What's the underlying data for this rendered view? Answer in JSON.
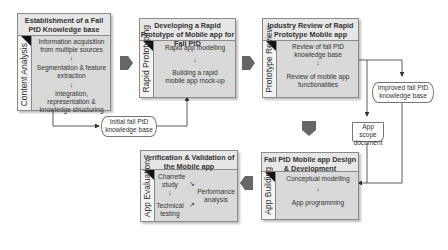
{
  "stages": [
    {
      "id": "content-analysis",
      "title": "Establishment of a Fall PtD Knowledge base",
      "side_label": "Content Analysis",
      "steps": [
        "Information acquisition from multiple sources",
        "Segmentation & feature extraction",
        "Integration, representation & knowledge structuring"
      ]
    },
    {
      "id": "rapid-prototyping",
      "title": "Developing a Rapid Prototype of Mobile app for Fall PtD",
      "side_label": "Rapid Prototyping",
      "steps": [
        "Rapid app modelling",
        "Building a rapid mobile app mock-up"
      ]
    },
    {
      "id": "prototype-review",
      "title": "Industry Review of Rapid Prototype Mobile app",
      "side_label": "Prototype Review",
      "steps": [
        "Review of fall PtD knowledge base",
        "Review of mobile app functionalities"
      ]
    },
    {
      "id": "app-building",
      "title": "Fall PtD Mobile app Design & Development",
      "side_label": "App Building",
      "steps": [
        "Conceptual modelling",
        "App programming"
      ]
    },
    {
      "id": "app-evaluation",
      "title": "Verification & Validation of the Mobile app",
      "side_label": "App Evaluation",
      "steps": [
        "Charrette study",
        "Technical testing",
        "Performance analysis"
      ]
    }
  ],
  "artifacts": {
    "initial_kb": "Initial fall PtD knowledge base",
    "improved_kb": "Improved fall PtD knowledge base",
    "scope_doc": "App scope document"
  },
  "colors": {
    "stage_fill": "#d9d9d9",
    "title_fill": "#e6e6e6",
    "arrow_fill": "#666666",
    "border": "#8a8a8a"
  }
}
